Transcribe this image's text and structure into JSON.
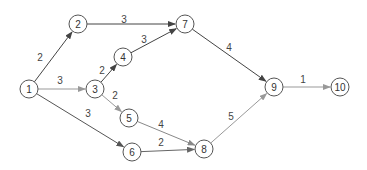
{
  "diagram": {
    "type": "directed-network",
    "nodes": [
      {
        "id": "1",
        "label": "1",
        "x": 29,
        "y": 89
      },
      {
        "id": "2",
        "label": "2",
        "x": 78,
        "y": 24
      },
      {
        "id": "3",
        "label": "3",
        "x": 95,
        "y": 89
      },
      {
        "id": "4",
        "label": "4",
        "x": 123,
        "y": 57
      },
      {
        "id": "5",
        "label": "5",
        "x": 129,
        "y": 118
      },
      {
        "id": "6",
        "label": "6",
        "x": 132,
        "y": 152
      },
      {
        "id": "7",
        "label": "7",
        "x": 185,
        "y": 24
      },
      {
        "id": "8",
        "label": "8",
        "x": 204,
        "y": 149
      },
      {
        "id": "9",
        "label": "9",
        "x": 274,
        "y": 87
      },
      {
        "id": "10",
        "label": "10",
        "x": 340,
        "y": 87
      }
    ],
    "edges": [
      {
        "from": "1",
        "to": "2",
        "weight": "2",
        "color": "#444444",
        "lx": 40,
        "ly": 57
      },
      {
        "from": "1",
        "to": "3",
        "weight": "3",
        "color": "#999999",
        "lx": 60,
        "ly": 80
      },
      {
        "from": "1",
        "to": "6",
        "weight": "3",
        "color": "#555555",
        "lx": 88,
        "ly": 113
      },
      {
        "from": "2",
        "to": "7",
        "weight": "3",
        "color": "#444444",
        "lx": 124,
        "ly": 19
      },
      {
        "from": "3",
        "to": "4",
        "weight": "2",
        "color": "#444444",
        "lx": 102,
        "ly": 70
      },
      {
        "from": "3",
        "to": "5",
        "weight": "2",
        "color": "#999999",
        "lx": 115,
        "ly": 95
      },
      {
        "from": "4",
        "to": "7",
        "weight": "3",
        "color": "#444444",
        "lx": 144,
        "ly": 39
      },
      {
        "from": "5",
        "to": "8",
        "weight": "4",
        "color": "#888888",
        "lx": 161,
        "ly": 124
      },
      {
        "from": "6",
        "to": "8",
        "weight": "2",
        "color": "#666666",
        "lx": 161,
        "ly": 142
      },
      {
        "from": "7",
        "to": "9",
        "weight": "4",
        "color": "#444444",
        "lx": 229,
        "ly": 47
      },
      {
        "from": "8",
        "to": "9",
        "weight": "5",
        "color": "#999999",
        "lx": 231,
        "ly": 116
      },
      {
        "from": "9",
        "to": "10",
        "weight": "1",
        "color": "#999999",
        "lx": 303,
        "ly": 79
      }
    ]
  }
}
